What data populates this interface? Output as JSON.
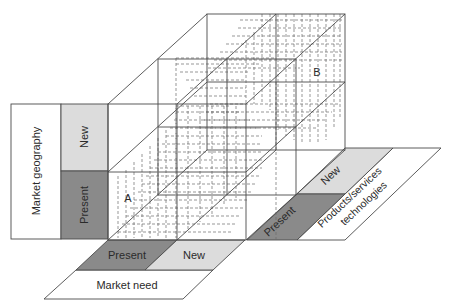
{
  "diagram": {
    "type": "3d-growth-matrix",
    "colors": {
      "present_fill": "#8a8a8a",
      "new_fill": "#dcdcdc",
      "label_fill": "#ffffff",
      "line": "#4a4a4a"
    },
    "axes": {
      "vertical": {
        "title": "Market geography",
        "levels": [
          "Present",
          "New"
        ]
      },
      "horizontal": {
        "title": "Market need",
        "levels": [
          "Present",
          "New"
        ]
      },
      "depth": {
        "title_line1": "Products/services",
        "title_line2": "technologies",
        "levels": [
          "Present",
          "New"
        ]
      }
    },
    "points": {
      "a": "A",
      "b": "B"
    }
  }
}
